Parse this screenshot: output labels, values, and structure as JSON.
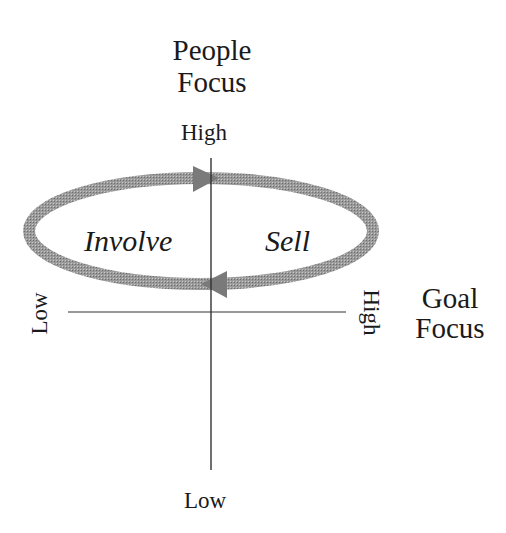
{
  "diagram": {
    "y_axis": {
      "title_line1": "People",
      "title_line2": "Focus",
      "high_label": "High",
      "low_label": "Low"
    },
    "x_axis": {
      "title_line1": "Goal",
      "title_line2": "Focus",
      "high_label": "High",
      "low_label": "Low"
    },
    "cycle": {
      "left_label": "Involve",
      "right_label": "Sell",
      "direction": "clockwise"
    },
    "colors": {
      "axis": "#333333",
      "cycle_arrow": "#8c8c8c",
      "text": "#1a1a1a"
    }
  }
}
